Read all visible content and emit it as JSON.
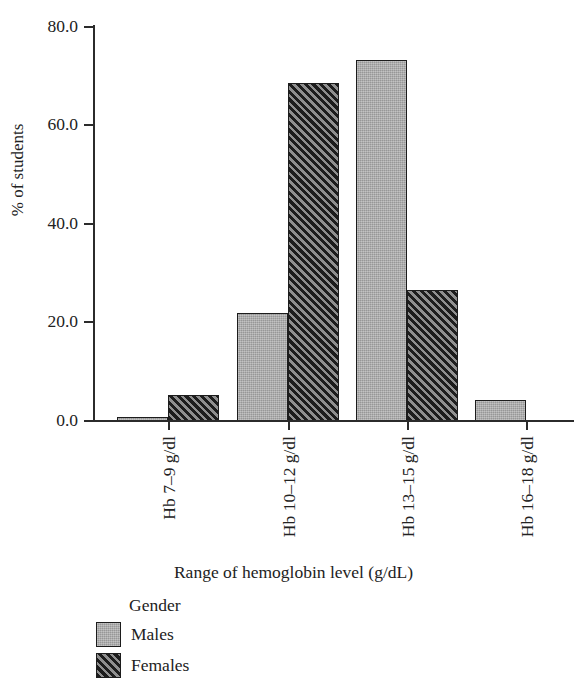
{
  "chart_data": {
    "type": "bar",
    "title": "",
    "xlabel": "Range of hemoglobin level (g/dL)",
    "ylabel": "% of students",
    "categories": [
      "Hb 7–9 g/dl",
      "Hb 10–12 g/dl",
      "Hb 13–15 g/dl",
      "Hb 16–18 g/dl"
    ],
    "series": [
      {
        "name": "Males",
        "values": [
          0.9,
          21.8,
          73.2,
          4.3
        ]
      },
      {
        "name": "Females",
        "values": [
          5.2,
          68.5,
          26.6,
          0.0
        ]
      }
    ],
    "ylim": [
      0,
      80
    ],
    "yticks": [
      "0.0",
      "20.0",
      "40.0",
      "60.0",
      "80.0"
    ],
    "ytick_values": [
      0,
      20,
      40,
      60,
      80
    ],
    "grid": false,
    "legend": {
      "title": "Gender",
      "position": "bottom-left",
      "entries": [
        {
          "label": "Males",
          "swatch": "solid-gray",
          "color": "#a9a9a9"
        },
        {
          "label": "Females",
          "swatch": "diagonal-hatch",
          "color": "#2e2e2e"
        }
      ]
    },
    "colors": {
      "males": "#a9a9a9",
      "females": "#2e2e2e",
      "axis": "#2b2b2b",
      "text": "#222222"
    }
  }
}
